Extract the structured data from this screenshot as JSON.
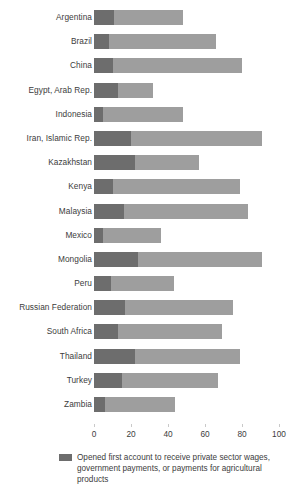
{
  "chart_data": {
    "type": "bar",
    "orientation": "horizontal",
    "stacked": true,
    "title": "",
    "xlabel": "",
    "ylabel": "",
    "xlim": [
      0,
      100
    ],
    "xticks": [
      0,
      20,
      40,
      60,
      80,
      100
    ],
    "grid": false,
    "legend_position": "bottom-left",
    "colors": {
      "first_account_private_sector": "#6d6d6d",
      "other_account_holders": "#9e9e9e"
    },
    "categories": [
      "Argentina",
      "Brazil",
      "China",
      "Egypt, Arab Rep.",
      "Indonesia",
      "Iran, Islamic Rep.",
      "Kazakhstan",
      "Kenya",
      "Malaysia",
      "Mexico",
      "Mongolia",
      "Peru",
      "Russian Federation",
      "South Africa",
      "Thailand",
      "Turkey",
      "Zambia"
    ],
    "series": [
      {
        "name": "Opened first account to receive private sector wages, government payments, or payments for agricultural products",
        "color": "#6d6d6d",
        "values": [
          11,
          8,
          10,
          13,
          5,
          20,
          22,
          10,
          16,
          5,
          24,
          9,
          17,
          13,
          22,
          15,
          6
        ]
      },
      {
        "name": "Remaining account holders",
        "color": "#9e9e9e",
        "values": [
          37,
          58,
          70,
          19,
          43,
          71,
          35,
          69,
          67,
          31,
          67,
          34,
          58,
          56,
          57,
          52,
          38
        ]
      }
    ],
    "totals": [
      48,
      66,
      80,
      32,
      48,
      91,
      57,
      79,
      83,
      36,
      91,
      43,
      75,
      69,
      79,
      67,
      44
    ]
  },
  "legend": {
    "entries": [
      {
        "swatch_name": "legend-swatch-dark",
        "label": "Opened first account to receive private sector wages, government payments, or payments for agricultural products"
      }
    ]
  },
  "axis": {
    "tick_labels": [
      "0",
      "20",
      "40",
      "60",
      "80",
      "100"
    ]
  }
}
